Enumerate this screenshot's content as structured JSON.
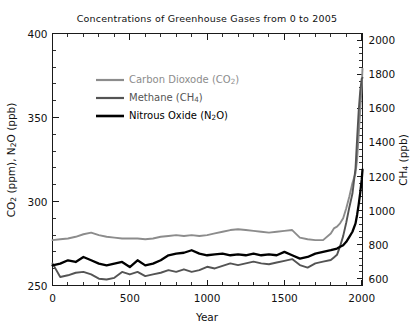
{
  "figure": {
    "title": "Concentrations of Greenhouse Gases from 0 to 2005",
    "background": "#ffffff",
    "frame_color": "#1a1a1a"
  },
  "axes": {
    "x": {
      "label": "Year",
      "ticks": [
        0,
        500,
        1000,
        1500,
        2000
      ],
      "tick_labels": [
        "0",
        "500",
        "1000",
        "1500",
        "2000"
      ],
      "range": [
        0,
        2005
      ],
      "minor_tick_interval": 100
    },
    "y_left": {
      "label_parts": {
        "a": "CO",
        "a_sub": "2",
        "b": " (ppm), N",
        "b_sub": "2",
        "c": "O (ppb)"
      },
      "label_plain": "CO2 (ppm), N2O (ppb)",
      "ticks": [
        250,
        300,
        350,
        400
      ],
      "tick_labels": [
        "250",
        "300",
        "350",
        "400"
      ],
      "range": [
        250,
        400
      ],
      "minor_tick_interval": 10
    },
    "y_right": {
      "label_parts": {
        "a": "CH",
        "a_sub": "4",
        "b": " (ppb)"
      },
      "label_plain": "CH4 (ppb)",
      "ticks": [
        600,
        800,
        1000,
        1200,
        1400,
        1600,
        1800,
        2000
      ],
      "tick_labels": [
        "600",
        "800",
        "1000",
        "1200",
        "1400",
        "1600",
        "1800",
        "2000"
      ],
      "range": [
        560,
        2040
      ],
      "minor_tick_interval": 40
    }
  },
  "legend": {
    "position": "upper-left-inset",
    "entries": [
      {
        "name": "carbon-dioxide",
        "text_a": "Carbon Dioxode (CO",
        "sub": "2",
        "text_b": ")",
        "plain": "Carbon Dioxode (CO2)",
        "color": "#8c8c8c",
        "width": 2.2
      },
      {
        "name": "methane",
        "text_a": "Methane (CH",
        "sub": "4",
        "text_b": ")",
        "plain": "Methane (CH4)",
        "color": "#545454",
        "width": 2.2
      },
      {
        "name": "nitrous-oxide",
        "text_a": "Nitrous Oxide (N",
        "sub": "2",
        "text_b": "O)",
        "plain": "Nitrous Oxide (N2O)",
        "color": "#000000",
        "width": 2.6
      }
    ]
  },
  "chart_data": {
    "type": "line",
    "title": "Concentrations of Greenhouse Gases from 0 to 2005",
    "xlabel": "Year",
    "ylabel": "CO2 (ppm), N2O (ppb)",
    "ylabel_right": "CH4 (ppb)",
    "xlim": [
      0,
      2005
    ],
    "ylim": [
      250,
      400
    ],
    "ylim_right": [
      560,
      2040
    ],
    "grid": false,
    "legend_position": "upper left (inset)",
    "series": [
      {
        "name": "Carbon Dioxode (CO2)",
        "axis": "left",
        "unit": "ppm",
        "color": "#8c8c8c",
        "x": [
          0,
          50,
          100,
          150,
          200,
          250,
          300,
          350,
          400,
          450,
          500,
          550,
          600,
          650,
          700,
          750,
          800,
          850,
          900,
          950,
          1000,
          1050,
          1100,
          1150,
          1200,
          1250,
          1300,
          1350,
          1400,
          1450,
          1500,
          1550,
          1600,
          1650,
          1700,
          1750,
          1800,
          1820,
          1840,
          1860,
          1880,
          1900,
          1920,
          1940,
          1960,
          1970,
          1980,
          1990,
          2000,
          2005
        ],
        "values": [
          277,
          277.5,
          278,
          279,
          280.5,
          281.5,
          280,
          279,
          278.5,
          278,
          278,
          278,
          277.5,
          278,
          279,
          279.5,
          280,
          279.5,
          280,
          279.5,
          280,
          281,
          282,
          283,
          283.5,
          283,
          282.5,
          282,
          281.5,
          282,
          282.5,
          283,
          278.5,
          277.5,
          277,
          277,
          281,
          284,
          285,
          287,
          290,
          296,
          303,
          311,
          317,
          325,
          339,
          354,
          369,
          379
        ]
      },
      {
        "name": "Methane (CH4)",
        "axis": "right",
        "unit": "ppb",
        "color": "#545454",
        "x": [
          0,
          50,
          100,
          150,
          200,
          250,
          300,
          350,
          400,
          450,
          500,
          550,
          600,
          650,
          700,
          750,
          800,
          850,
          900,
          950,
          1000,
          1050,
          1100,
          1150,
          1200,
          1250,
          1300,
          1350,
          1400,
          1450,
          1500,
          1550,
          1600,
          1650,
          1700,
          1750,
          1800,
          1820,
          1840,
          1860,
          1880,
          1900,
          1920,
          1940,
          1960,
          1970,
          1980,
          1990,
          2000,
          2005
        ],
        "values": [
          690,
          610,
          620,
          635,
          640,
          625,
          600,
          595,
          605,
          640,
          625,
          640,
          615,
          625,
          635,
          650,
          640,
          655,
          640,
          650,
          670,
          660,
          675,
          690,
          680,
          690,
          700,
          690,
          685,
          695,
          705,
          715,
          680,
          665,
          690,
          700,
          710,
          725,
          740,
          790,
          850,
          930,
          1020,
          1100,
          1250,
          1420,
          1580,
          1700,
          1775,
          1780
        ]
      },
      {
        "name": "Nitrous Oxide (N2O)",
        "axis": "left",
        "unit": "ppb",
        "color": "#000000",
        "x": [
          0,
          50,
          100,
          150,
          200,
          250,
          300,
          350,
          400,
          450,
          500,
          550,
          600,
          650,
          700,
          750,
          800,
          850,
          900,
          950,
          1000,
          1050,
          1100,
          1150,
          1200,
          1250,
          1300,
          1350,
          1400,
          1450,
          1500,
          1550,
          1600,
          1650,
          1700,
          1750,
          1800,
          1820,
          1840,
          1860,
          1880,
          1900,
          1920,
          1940,
          1960,
          1970,
          1980,
          1990,
          2000,
          2005
        ],
        "values": [
          262,
          263,
          265,
          264,
          267,
          265,
          263,
          262,
          263,
          264,
          261,
          265,
          262,
          263,
          265,
          268,
          269,
          269.5,
          271,
          269,
          268,
          268.5,
          269,
          268,
          268.5,
          268,
          269,
          268,
          268.5,
          268,
          270,
          268,
          266,
          267,
          269,
          270,
          271,
          271.5,
          272,
          273,
          274,
          276,
          279,
          282,
          287,
          292,
          298,
          305,
          313,
          319
        ]
      }
    ]
  }
}
